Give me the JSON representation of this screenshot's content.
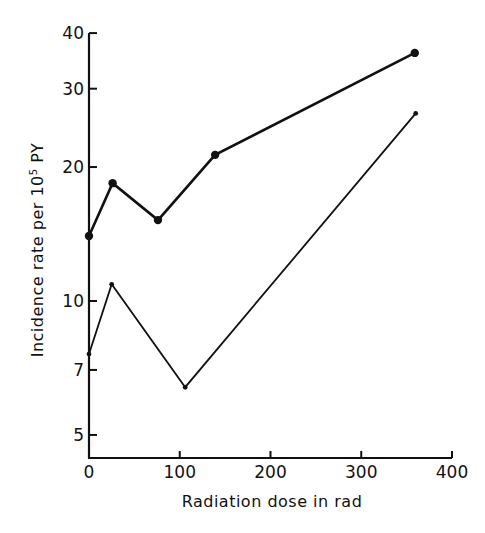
{
  "chart_data": {
    "type": "line",
    "title": "",
    "xlabel": "Radiation dose in rad",
    "ylabel": "Incidence rate per 10⁵ PY",
    "ylabel_parts": {
      "before": "Incidence rate per 10",
      "sup": "5",
      "after": " PY"
    },
    "xscale": "linear",
    "yscale": "log",
    "xlim": [
      0,
      400
    ],
    "ylim": [
      4.45,
      40
    ],
    "x_ticks": [
      0,
      100,
      200,
      300,
      400
    ],
    "x_tick_labels": [
      "0",
      "100",
      "200",
      "300",
      "400"
    ],
    "y_ticks": [
      5,
      7,
      10,
      20,
      30,
      40
    ],
    "y_tick_labels": [
      "5",
      "7",
      "10",
      "20",
      "30",
      "40"
    ],
    "grid": false,
    "legend": null,
    "series": [
      {
        "name": "Upper series (large markers, bold line)",
        "marker": "large-dot",
        "x": [
          0,
          26,
          76,
          139,
          359
        ],
        "values": [
          14.0,
          18.4,
          15.2,
          21.3,
          36.1
        ]
      },
      {
        "name": "Lower series (small markers, thin line)",
        "marker": "small-dot",
        "x": [
          0,
          25,
          106,
          360
        ],
        "values": [
          7.6,
          10.9,
          6.4,
          26.4
        ]
      }
    ]
  },
  "layout": {
    "plot": {
      "x0": 89,
      "x1": 452,
      "y_axis_top": 33,
      "y_axis_bottom": 458,
      "y10_px": 301,
      "px_per_decade": 445
    },
    "colors": {
      "ink": "#111111",
      "background": "#ffffff"
    }
  }
}
